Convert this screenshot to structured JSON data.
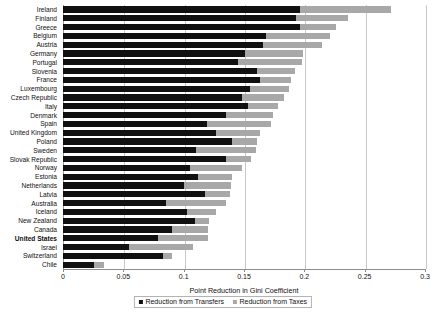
{
  "chart_data": {
    "type": "bar",
    "orientation": "horizontal",
    "stacked": true,
    "title": "",
    "xlabel": "Point Reduction in Gini Coefficient",
    "ylabel": "",
    "xlim": [
      0,
      0.3
    ],
    "xticks": [
      "0",
      "0.05",
      "0.1",
      "0.15",
      "0.2",
      "0.25",
      "0.3"
    ],
    "xtick_values": [
      0,
      0.05,
      0.1,
      0.15,
      0.2,
      0.25,
      0.3
    ],
    "grid": true,
    "legend_position": "bottom",
    "categories": [
      "Ireland",
      "Finland",
      "Greece",
      "Belgium",
      "Austria",
      "Germany",
      "Portugal",
      "Slovenia",
      "France",
      "Luxembourg",
      "Czech Republic",
      "Italy",
      "Denmark",
      "Spain",
      "United Kingdom",
      "Poland",
      "Sweden",
      "Slovak Republic",
      "Norway",
      "Estonia",
      "Netherlands",
      "Latvia",
      "Australia",
      "Iceland",
      "New Zealand",
      "Canada",
      "United States",
      "Israel",
      "Switzerland",
      "Chile"
    ],
    "highlight_category": "United States",
    "series": [
      {
        "name": "Reduction from Transfers",
        "color": "#101010",
        "values": [
          0.196,
          0.193,
          0.196,
          0.168,
          0.166,
          0.151,
          0.145,
          0.161,
          0.163,
          0.155,
          0.148,
          0.153,
          0.135,
          0.119,
          0.127,
          0.14,
          0.11,
          0.135,
          0.105,
          0.112,
          0.1,
          0.118,
          0.085,
          0.103,
          0.109,
          0.09,
          0.079,
          0.055,
          0.083,
          0.026
        ]
      },
      {
        "name": "Reduction from Taxes",
        "color": "#a8a8a8",
        "values": [
          0.076,
          0.043,
          0.03,
          0.053,
          0.049,
          0.048,
          0.053,
          0.031,
          0.026,
          0.032,
          0.035,
          0.025,
          0.039,
          0.053,
          0.036,
          0.021,
          0.05,
          0.021,
          0.043,
          0.028,
          0.039,
          0.02,
          0.05,
          0.024,
          0.012,
          0.03,
          0.041,
          0.053,
          0.007,
          0.008
        ]
      }
    ]
  },
  "legend": {
    "items": [
      {
        "label": "Reduction from Transfers",
        "color": "#101010"
      },
      {
        "label": "Reduction from Taxes",
        "color": "#a8a8a8"
      }
    ]
  }
}
